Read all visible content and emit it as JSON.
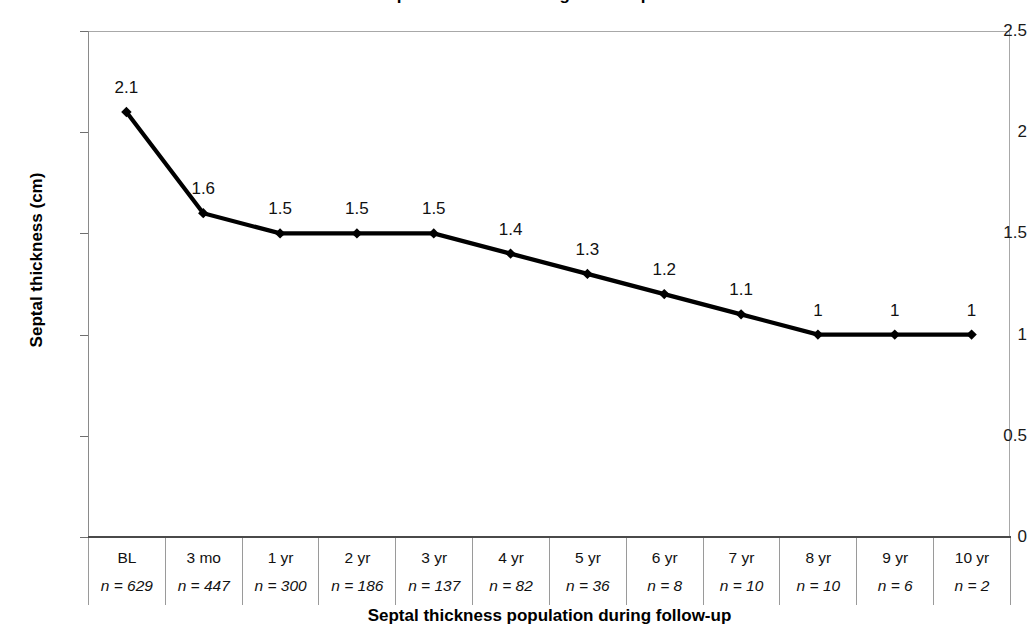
{
  "chart_data": {
    "type": "line",
    "title": "Septal thickness during follow-up",
    "xlabel": "Septal thickness population during follow-up",
    "ylabel": "Septal thickness (cm)",
    "categories": [
      "BL",
      "3 mo",
      "1 yr",
      "2 yr",
      "3 yr",
      "4 yr",
      "5 yr",
      "6 yr",
      "7 yr",
      "8 yr",
      "9 yr",
      "10 yr"
    ],
    "values": [
      2.1,
      1.6,
      1.5,
      1.5,
      1.5,
      1.4,
      1.3,
      1.2,
      1.1,
      1,
      1,
      1
    ],
    "point_labels": [
      "2.1",
      "1.6",
      "1.5",
      "1.5",
      "1.5",
      "1.4",
      "1.3",
      "1.2",
      "1.1",
      "1",
      "1",
      "1"
    ],
    "n_values": [
      629,
      447,
      300,
      186,
      137,
      82,
      36,
      8,
      10,
      10,
      6,
      2
    ],
    "n_labels": [
      "n = 629",
      "n = 447",
      "n = 300",
      "n = 186",
      "n = 137",
      "n = 82",
      "n = 36",
      "n = 8",
      "n = 10",
      "n = 10",
      "n = 6",
      "n = 2"
    ],
    "ylim": [
      0,
      2.5
    ],
    "ytick_values": [
      0,
      0.5,
      1,
      1.5,
      2,
      2.5
    ],
    "ytick_labels": [
      "0",
      "0.5",
      "1",
      "1.5",
      "2",
      "2.5"
    ],
    "grid": false,
    "legend": "none",
    "series_color": "#000000",
    "marker": "diamond",
    "frame_color": "#a8a8a8",
    "axis_color": "#4a4a4a"
  }
}
